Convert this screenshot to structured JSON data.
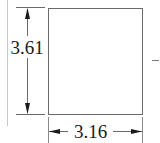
{
  "diagram": {
    "type": "dimensioned-rectangle",
    "shape": "rectangle",
    "dimensions": {
      "height_label": "3.61",
      "width_label": "3.16"
    },
    "colors": {
      "stroke": "#3a3a3a",
      "light_stroke": "#bbbbbb",
      "text": "#1a1a1a",
      "background": "#ffffff"
    }
  }
}
